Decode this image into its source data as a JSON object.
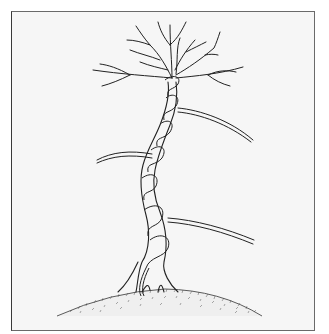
{
  "illustration": {
    "subject": "bonsai-tree-with-wired-trunk",
    "style": "pen-and-ink line drawing",
    "caption": "",
    "colors": {
      "ink": "#222222",
      "paper": "#f6f6f6",
      "frame": "#5a5a5a",
      "wire_highlight": "#ffffff"
    },
    "elements": [
      "frame",
      "canopy-branches",
      "trunk",
      "copper-wire-coil",
      "side-branches",
      "exposed-roots",
      "soil-mound"
    ]
  }
}
